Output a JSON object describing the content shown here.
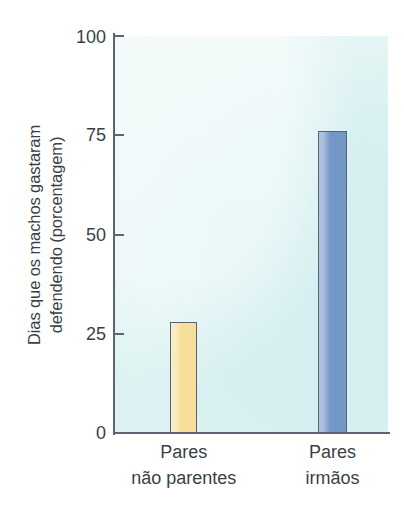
{
  "chart_data": {
    "type": "bar",
    "title": "",
    "xlabel": "",
    "ylabel": "Dias que os machos gastaram defendendo (porcentagem)",
    "ylabel_line1": "Dias que os machos gastaram",
    "ylabel_line2": "defendendo (porcentagem)",
    "categories": [
      "Pares não parentes",
      "Pares irmãos"
    ],
    "category_lines": [
      {
        "line1": "Pares",
        "line2": "não parentes"
      },
      {
        "line1": "Pares",
        "line2": "irmãos"
      }
    ],
    "values": [
      28,
      76
    ],
    "ylim": [
      0,
      100
    ],
    "yticks": [
      100,
      75,
      50,
      25,
      0
    ],
    "ytick_labels": [
      "100",
      "75",
      "50",
      "25",
      "0"
    ],
    "grid": false,
    "legend": "none",
    "bar_colors": [
      "#f7de9a",
      "#7296c6"
    ],
    "bar_edge_color": "#5b6470",
    "plot_background": "#ddf2f2",
    "axis_color": "#5b6470",
    "text_color": "#3a3f45"
  },
  "figure": {
    "background": "#ffffff"
  }
}
